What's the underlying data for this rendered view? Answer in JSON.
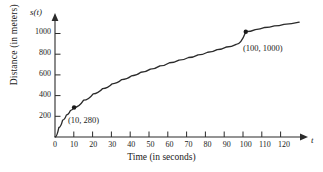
{
  "chart_data": {
    "type": "line",
    "title": "",
    "xlabel": "Time (in seconds)",
    "ylabel": "Distance (in meters)",
    "x_axis_symbol": "t",
    "y_axis_symbol": "s(t)",
    "xlim": [
      0,
      130
    ],
    "ylim": [
      0,
      1130
    ],
    "xticks": [
      0,
      10,
      20,
      30,
      40,
      50,
      60,
      70,
      80,
      90,
      100,
      110,
      120
    ],
    "xtick_labels": [
      "0",
      "10",
      "20",
      "30",
      "40",
      "50",
      "60",
      "70",
      "80",
      "90",
      "100",
      "110",
      "120"
    ],
    "yticks": [
      200,
      400,
      600,
      800,
      1000
    ],
    "ytick_labels": [
      "200",
      "400",
      "600",
      "800",
      "1000"
    ],
    "grid": false,
    "legend": "none",
    "series": [
      {
        "name": "s(t)",
        "points": [
          [
            0,
            0
          ],
          [
            2,
            90
          ],
          [
            4,
            160
          ],
          [
            6,
            210
          ],
          [
            8,
            250
          ],
          [
            10,
            280
          ],
          [
            15,
            350
          ],
          [
            20,
            410
          ],
          [
            25,
            460
          ],
          [
            30,
            505
          ],
          [
            35,
            545
          ],
          [
            40,
            580
          ],
          [
            45,
            615
          ],
          [
            50,
            645
          ],
          [
            55,
            675
          ],
          [
            60,
            705
          ],
          [
            65,
            730
          ],
          [
            70,
            755
          ],
          [
            75,
            780
          ],
          [
            80,
            805
          ],
          [
            85,
            830
          ],
          [
            90,
            855
          ],
          [
            95,
            880
          ],
          [
            100,
            1000
          ],
          [
            105,
            1020
          ],
          [
            110,
            1040
          ],
          [
            115,
            1055
          ],
          [
            120,
            1070
          ],
          [
            128,
            1090
          ]
        ]
      }
    ],
    "annotations": [
      {
        "label": "(10, 280)",
        "x": 10,
        "y": 280,
        "marker": true
      },
      {
        "label": "(100, 1000)",
        "x": 100,
        "y": 1000,
        "marker": true
      }
    ],
    "colors": {
      "curve": "#2b2b2b",
      "axis": "#2b2b2b",
      "marker": "#1a1a1a",
      "background": "#ffffff"
    }
  }
}
